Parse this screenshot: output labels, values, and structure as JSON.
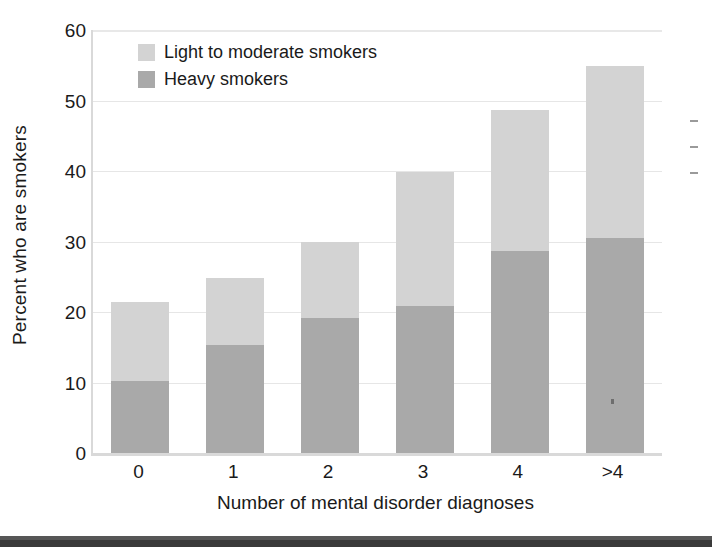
{
  "chart_data": {
    "type": "bar",
    "stacked": true,
    "title": "",
    "xlabel": "Number of mental disorder diagnoses",
    "ylabel": "Percent who are smokers",
    "categories": [
      "0",
      "1",
      "2",
      "3",
      "4",
      ">4"
    ],
    "series": [
      {
        "name": "Heavy smokers",
        "color": "#a9a9a9",
        "values": [
          10.2,
          15.3,
          19.2,
          20.8,
          28.6,
          30.5
        ]
      },
      {
        "name": "Light to moderate smokers",
        "color": "#d3d3d3",
        "values": [
          11.2,
          9.5,
          10.7,
          19.0,
          20.1,
          24.4
        ]
      }
    ],
    "stack_totals": [
      21.4,
      24.8,
      29.9,
      39.8,
      48.7,
      54.9
    ],
    "ylim": [
      0,
      60
    ],
    "yticks": [
      0,
      10,
      20,
      30,
      40,
      50,
      60
    ],
    "ytick_labels": [
      "0",
      "10",
      "20",
      "30",
      "40",
      "50",
      "60"
    ],
    "grid": true,
    "grid_axis": "y",
    "legend_position": "top-left-inside",
    "legend": [
      {
        "label": "Light to moderate smokers",
        "color": "#d3d3d3"
      },
      {
        "label": "Heavy smokers",
        "color": "#a9a9a9"
      }
    ]
  },
  "colors": {
    "light_smokers": "#d3d3d3",
    "heavy_smokers": "#a9a9a9",
    "axis": "#d9d9d9",
    "grid": "#e6e6e6",
    "text": "#1a1a1a",
    "page_rule": "#3a3a3a"
  }
}
